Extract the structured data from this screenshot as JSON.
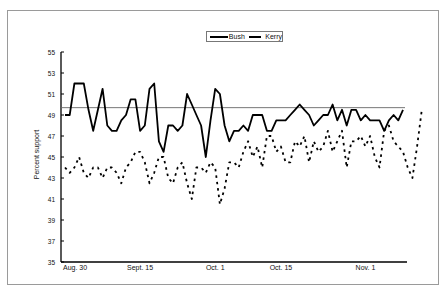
{
  "chart_data": {
    "type": "line",
    "title": "",
    "xlabel": "",
    "ylabel": "Percent support",
    "ylim": [
      35,
      55
    ],
    "yticks": [
      35,
      37,
      39,
      41,
      43,
      45,
      47,
      49,
      51,
      53,
      55
    ],
    "xtick_labels": [
      "Aug. 30",
      "Sept. 15",
      "Oct. 1",
      "Oct. 15",
      "Nov. 1"
    ],
    "xtick_index": [
      0,
      16,
      32,
      46,
      64
    ],
    "grid": false,
    "legend_position": "top-center",
    "reference_line": 49.7,
    "series": [
      {
        "name": "Bush",
        "style": "solid",
        "values": [
          49,
          49,
          52,
          52,
          52,
          49.5,
          47.5,
          49.5,
          51.5,
          48,
          47.5,
          47.5,
          48.5,
          49,
          50.5,
          50.5,
          47.5,
          48,
          51.5,
          52,
          46.5,
          45.5,
          48,
          48,
          47.5,
          48,
          51,
          50,
          49,
          48,
          45,
          48.5,
          51.5,
          51,
          48,
          46.5,
          47.5,
          47.5,
          48,
          47.5,
          49,
          49,
          49,
          47.5,
          47.5,
          48.5,
          48.5,
          48.5,
          49,
          49.5,
          50,
          49.5,
          49,
          48,
          48.5,
          49,
          49,
          50,
          48.5,
          49.5,
          48,
          49.5,
          49.5,
          48.5,
          49,
          48.5,
          48.5,
          48.5,
          47.5,
          48.5,
          49,
          48.5,
          49.5
        ]
      },
      {
        "name": "Kerry",
        "style": "dashed",
        "values": [
          44,
          43.5,
          44,
          45,
          43.5,
          43,
          44,
          44,
          43,
          44,
          44,
          43.5,
          42.5,
          44,
          44.5,
          45.5,
          45.5,
          44.5,
          42.5,
          43.5,
          45,
          45,
          43,
          42.5,
          44,
          44.5,
          42.5,
          41,
          44,
          44,
          43.5,
          44.5,
          44,
          40.5,
          42,
          44.5,
          44.5,
          44,
          45.5,
          46.5,
          45,
          46,
          44,
          47,
          47,
          45.5,
          46,
          44.5,
          44.5,
          46.5,
          46,
          47,
          44.5,
          46.5,
          45.5,
          46,
          47.5,
          45.5,
          46.5,
          47.5,
          44,
          46.5,
          46.5,
          47,
          46,
          47,
          45,
          44,
          47.5,
          48,
          46.5,
          46,
          45.5,
          44,
          43,
          46,
          49.5
        ]
      }
    ]
  },
  "legend": {
    "items": [
      {
        "label": "Bush",
        "style": "solid"
      },
      {
        "label": "Kerry",
        "style": "dashed"
      }
    ]
  },
  "axis": {
    "y_label": "Percent support",
    "y_ticks": [
      "55",
      "53",
      "51",
      "49",
      "47",
      "45",
      "43",
      "41",
      "39",
      "37",
      "35"
    ],
    "x_ticks": [
      "Aug. 30",
      "Sept. 15",
      "Oct. 1",
      "Oct. 15",
      "Nov. 1"
    ]
  }
}
